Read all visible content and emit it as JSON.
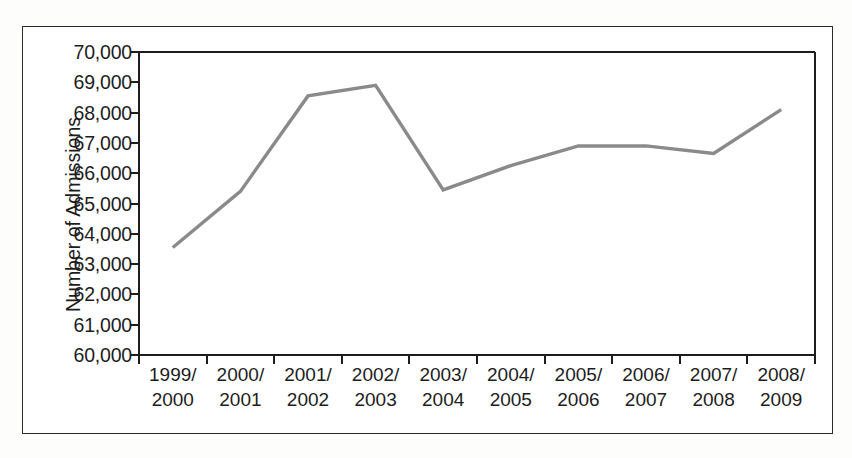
{
  "chart_data": {
    "type": "line",
    "title": "",
    "xlabel": "",
    "ylabel": "Number of Admissions",
    "categories": [
      "1999/\n2000",
      "2000/\n2001",
      "2001/\n2002",
      "2002/\n2003",
      "2003/\n2004",
      "2004/\n2005",
      "2005/\n2006",
      "2006/\n2007",
      "2007/\n2008",
      "2008/\n2009"
    ],
    "category_lines": [
      [
        "1999/",
        "2000"
      ],
      [
        "2000/",
        "2001"
      ],
      [
        "2001/",
        "2002"
      ],
      [
        "2002/",
        "2003"
      ],
      [
        "2003/",
        "2004"
      ],
      [
        "2004/",
        "2005"
      ],
      [
        "2005/",
        "2006"
      ],
      [
        "2006/",
        "2007"
      ],
      [
        "2007/",
        "2008"
      ],
      [
        "2008/",
        "2009"
      ]
    ],
    "values": [
      63550,
      65400,
      68550,
      68900,
      65450,
      66250,
      66900,
      66900,
      66650,
      68100
    ],
    "ylim": [
      60000,
      70000
    ],
    "ytick_values": [
      70000,
      69000,
      68000,
      67000,
      66000,
      65000,
      64000,
      63000,
      62000,
      61000,
      60000
    ],
    "ytick_labels": [
      "70,000",
      "69,000",
      "68,000",
      "67,000",
      "66,000",
      "65,000",
      "64,000",
      "63,000",
      "62,000",
      "61,000",
      "60,000"
    ],
    "grid": false,
    "legend": false,
    "series_color": "#8a8a8a",
    "axis_color": "#1d1d1d"
  }
}
